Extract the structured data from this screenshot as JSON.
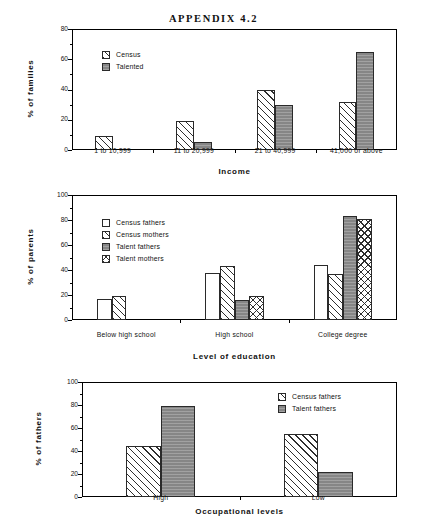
{
  "page": {
    "title": "APPENDIX 4.2"
  },
  "charts": [
    {
      "id": "income-chart",
      "ylabel": "% of families",
      "xlabel": "Income",
      "yticks": [
        "0",
        "20",
        "40",
        "60",
        "80"
      ],
      "categories": [
        "1 to 10,999",
        "11 to 20,999",
        "21 to 40,999",
        "41,000 or above"
      ],
      "legend": [
        {
          "label": "Census",
          "pattern": "fill-hatch"
        },
        {
          "label": "Talented",
          "pattern": "fill-solidgray"
        }
      ]
    },
    {
      "id": "education-chart",
      "ylabel": "% of parents",
      "xlabel": "Level of education",
      "yticks": [
        "0",
        "20",
        "40",
        "60",
        "80",
        "100"
      ],
      "categories": [
        "Below high school",
        "High school",
        "College degree"
      ],
      "legend": [
        {
          "label": "Census fathers",
          "pattern": "fill-white"
        },
        {
          "label": "Census mothers",
          "pattern": "fill-hatch"
        },
        {
          "label": "Talent fathers",
          "pattern": "fill-solidgray"
        },
        {
          "label": "Talent mothers",
          "pattern": "fill-cross"
        }
      ]
    },
    {
      "id": "occupation-chart",
      "ylabel": "% of fathers",
      "xlabel": "Occupational levels",
      "yticks": [
        "0",
        "20",
        "40",
        "60",
        "80",
        "100"
      ],
      "categories": [
        "High",
        "Low"
      ],
      "legend": [
        {
          "label": "Census fathers",
          "pattern": "fill-hatch"
        },
        {
          "label": "Talent fathers",
          "pattern": "fill-solidgray"
        }
      ]
    }
  ],
  "chart_data": [
    {
      "type": "bar",
      "title": "",
      "xlabel": "Income",
      "ylabel": "% of families",
      "ylim": [
        0,
        80
      ],
      "ytick_step": 20,
      "minor_tick_step": 10,
      "grid": false,
      "legend_position": "inside-upper-left",
      "categories": [
        "1 to 10,999",
        "11 to 20,999",
        "21 to 40,999",
        "41,000 or above"
      ],
      "series": [
        {
          "name": "Census",
          "values": [
            9,
            19,
            40,
            32
          ],
          "pattern": "diagonal-hatch"
        },
        {
          "name": "Talented",
          "values": [
            0,
            5,
            30,
            65
          ],
          "pattern": "solid-gray"
        }
      ]
    },
    {
      "type": "bar",
      "title": "",
      "xlabel": "Level of education",
      "ylabel": "% of parents",
      "ylim": [
        0,
        100
      ],
      "ytick_step": 20,
      "minor_tick_step": 10,
      "grid": false,
      "legend_position": "inside-upper-left",
      "categories": [
        "Below high school",
        "High school",
        "College degree"
      ],
      "series": [
        {
          "name": "Census fathers",
          "values": [
            17,
            37.5,
            44
          ],
          "pattern": "white"
        },
        {
          "name": "Census mothers",
          "values": [
            19.5,
            43.5,
            36.5
          ],
          "pattern": "diagonal-hatch"
        },
        {
          "name": "Talent fathers",
          "values": [
            0,
            16,
            83
          ],
          "pattern": "solid-gray"
        },
        {
          "name": "Talent mothers",
          "values": [
            0,
            19.5,
            80.5
          ],
          "pattern": "cross-hatch"
        }
      ]
    },
    {
      "type": "bar",
      "title": "",
      "xlabel": "Occupational levels",
      "ylabel": "% of fathers",
      "ylim": [
        0,
        100
      ],
      "ytick_step": 20,
      "minor_tick_step": 10,
      "grid": false,
      "legend_position": "inside-upper-right",
      "categories": [
        "High",
        "Low"
      ],
      "series": [
        {
          "name": "Census fathers",
          "values": [
            44,
            55
          ],
          "pattern": "diagonal-hatch"
        },
        {
          "name": "Talent fathers",
          "values": [
            79,
            22
          ],
          "pattern": "solid-gray"
        }
      ]
    }
  ]
}
